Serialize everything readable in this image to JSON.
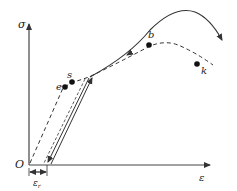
{
  "diagram": {
    "type": "stress-strain curve with unloading/reloading",
    "axes": {
      "y_label": "σ",
      "x_label": "ε",
      "origin_label": "O"
    },
    "points": [
      {
        "id": "e",
        "label": "e"
      },
      {
        "id": "s",
        "label": "s"
      },
      {
        "id": "b",
        "label": "b"
      },
      {
        "id": "k",
        "label": "k"
      }
    ],
    "dimension": {
      "label": "ε",
      "subscript": "r"
    },
    "curves": [
      {
        "name": "original-curve",
        "style": "dashed",
        "description": "O → e → s → b → k"
      },
      {
        "name": "unload-line",
        "style": "solid-with-arrow",
        "description": "yield point down to residual strain"
      },
      {
        "name": "reload-line",
        "style": "solid-with-arrow",
        "description": "residual strain up to yield point, continuing to higher peak"
      }
    ],
    "colors": {
      "line": "#333333",
      "background": "#ffffff"
    }
  }
}
